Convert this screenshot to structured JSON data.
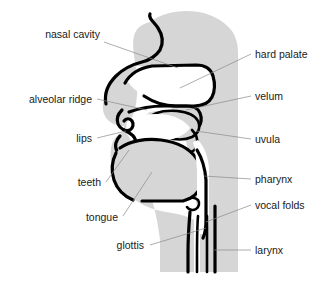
{
  "figure": {
    "colors": {
      "tissue_fill": "#d6d6d6",
      "outline": "#000000",
      "airway": "#ffffff",
      "leader_line": "#8a8a8a",
      "label_text": "#1a1a1a",
      "background": "#ffffff"
    }
  },
  "labels": {
    "left": [
      {
        "id": "nasal-cavity",
        "text": "nasal cavity",
        "tx": 100,
        "ty": 38,
        "lx1": 104,
        "ly1": 42,
        "lx2": 178,
        "ly2": 68
      },
      {
        "id": "alveolar-ridge",
        "text": "alveolar ridge",
        "tx": 92,
        "ty": 101,
        "lx1": 97,
        "ly1": 99,
        "lx2": 147,
        "ly2": 110
      },
      {
        "id": "lips",
        "text": "lips",
        "tx": 92,
        "ty": 141,
        "lx1": 97,
        "ly1": 138,
        "lx2": 126,
        "ly2": 131
      },
      {
        "id": "teeth",
        "text": "teeth",
        "tx": 101,
        "ty": 186,
        "lx1": 106,
        "ly1": 182,
        "lx2": 129,
        "ly2": 150
      },
      {
        "id": "tongue",
        "text": "tongue",
        "tx": 118,
        "ty": 221,
        "lx1": 123,
        "ly1": 216,
        "lx2": 152,
        "ly2": 172
      },
      {
        "id": "glottis",
        "text": "glottis",
        "tx": 144,
        "ty": 249,
        "lx1": 150,
        "ly1": 245,
        "lx2": 206,
        "ly2": 228
      }
    ],
    "right": [
      {
        "id": "hard-palate",
        "text": "hard palate",
        "tx": 255,
        "ty": 57,
        "lx1": 251,
        "ly1": 54,
        "lx2": 180,
        "ly2": 88
      },
      {
        "id": "velum",
        "text": "velum",
        "tx": 255,
        "ty": 99,
        "lx1": 251,
        "ly1": 96,
        "lx2": 186,
        "ly2": 110
      },
      {
        "id": "uvula",
        "text": "uvula",
        "tx": 255,
        "ty": 142,
        "lx1": 251,
        "ly1": 139,
        "lx2": 196,
        "ly2": 131
      },
      {
        "id": "pharynx",
        "text": "pharynx",
        "tx": 255,
        "ty": 182,
        "lx1": 251,
        "ly1": 179,
        "lx2": 204,
        "ly2": 176
      },
      {
        "id": "vocal-folds",
        "text": "vocal folds",
        "tx": 255,
        "ty": 208,
        "lx1": 251,
        "ly1": 205,
        "lx2": 206,
        "ly2": 222
      },
      {
        "id": "larynx",
        "text": "larynx",
        "tx": 255,
        "ty": 253,
        "lx1": 251,
        "ly1": 250,
        "lx2": 215,
        "ly2": 250
      }
    ]
  }
}
